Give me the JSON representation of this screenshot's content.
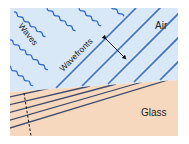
{
  "diagram": {
    "labels": {
      "waves": "Waves",
      "wavefronts": "Wavefronts",
      "air": "Air",
      "glass": "Glass"
    },
    "colors": {
      "air": "#d8e8f6",
      "glass": "#f6d8be",
      "wave_line": "#2b66c4",
      "wavefront_air": "#3e6fc0",
      "wavefront_glass": "#3d4a6a",
      "arrow": "#111111",
      "background": "#ffffff"
    },
    "regions": [
      {
        "name": "air",
        "label": "Air"
      },
      {
        "name": "glass",
        "label": "Glass"
      }
    ]
  }
}
